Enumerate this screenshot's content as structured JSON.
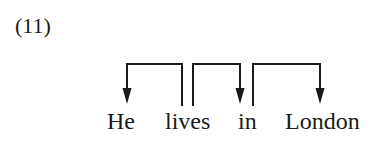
{
  "example_number": "(11)",
  "sentence": {
    "words": [
      "He",
      "lives",
      "in",
      "London"
    ]
  },
  "dependencies": [
    {
      "head": "lives",
      "dependent": "He",
      "direction": "left"
    },
    {
      "head": "lives",
      "dependent": "in",
      "direction": "right"
    },
    {
      "head": "in",
      "dependent": "London",
      "direction": "right"
    }
  ],
  "colors": {
    "ink": "#1a1a1a",
    "background": "#ffffff"
  }
}
